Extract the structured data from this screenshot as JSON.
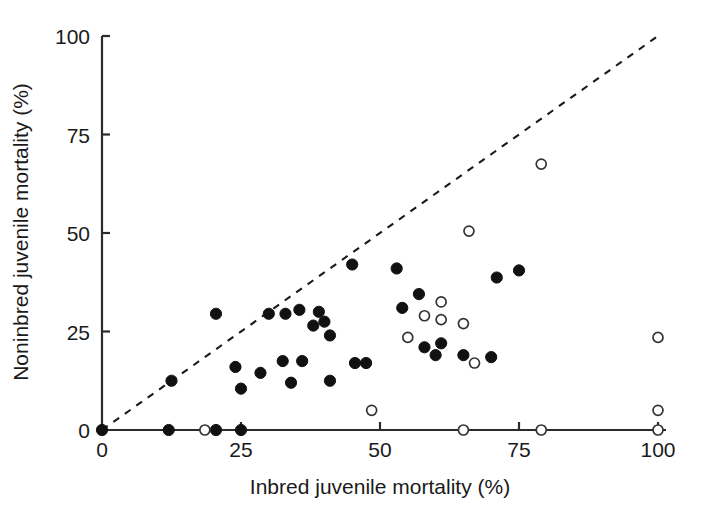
{
  "chart_data": {
    "type": "scatter",
    "title": "",
    "xlabel": "Inbred juvenile mortality (%)",
    "ylabel": "Noninbred juvenile mortality (%)",
    "xlim": [
      0,
      100
    ],
    "ylim": [
      0,
      100
    ],
    "xticks": [
      0,
      25,
      50,
      75,
      100
    ],
    "yticks": [
      0,
      25,
      50,
      75,
      100
    ],
    "xticklabels": [
      "0",
      "25",
      "50",
      "75",
      "100"
    ],
    "yticklabels": [
      "0",
      "25",
      "50",
      "75",
      "100"
    ],
    "grid": false,
    "legend": null,
    "annotations": [
      {
        "name": "identity-reference-line",
        "type": "line",
        "style": "dashed",
        "from": [
          0,
          0
        ],
        "to": [
          100,
          100
        ],
        "label": "y = x"
      }
    ],
    "series": [
      {
        "name": "filled-markers",
        "marker": "filled-circle",
        "color": "#111111",
        "points": [
          [
            0,
            0
          ],
          [
            12,
            0
          ],
          [
            20.5,
            0
          ],
          [
            25,
            0
          ],
          [
            12.5,
            12.5
          ],
          [
            20.5,
            29.5
          ],
          [
            24,
            16
          ],
          [
            25,
            10.5
          ],
          [
            28.5,
            14.5
          ],
          [
            30,
            29.5
          ],
          [
            32.5,
            17.5
          ],
          [
            33,
            29.5
          ],
          [
            34,
            12
          ],
          [
            35.5,
            30.5
          ],
          [
            36,
            17.5
          ],
          [
            38,
            26.5
          ],
          [
            39,
            30
          ],
          [
            40,
            27.5
          ],
          [
            41,
            12.5
          ],
          [
            41,
            24
          ],
          [
            45,
            42
          ],
          [
            45.5,
            17
          ],
          [
            47.5,
            17
          ],
          [
            53,
            41
          ],
          [
            54,
            31
          ],
          [
            57,
            34.5
          ],
          [
            58,
            21
          ],
          [
            60,
            19
          ],
          [
            61,
            22
          ],
          [
            65,
            19
          ],
          [
            70,
            18.5
          ],
          [
            71,
            38.7
          ],
          [
            75,
            40.5
          ]
        ]
      },
      {
        "name": "open-markers",
        "marker": "open-circle",
        "color": "#ffffff",
        "points": [
          [
            18.5,
            0
          ],
          [
            48.5,
            5
          ],
          [
            55,
            23.5
          ],
          [
            58,
            29
          ],
          [
            61,
            28
          ],
          [
            61,
            32.5
          ],
          [
            65,
            27
          ],
          [
            65,
            0
          ],
          [
            66,
            50.5
          ],
          [
            67,
            17
          ],
          [
            79,
            67.5
          ],
          [
            79,
            0
          ],
          [
            100,
            23.5
          ],
          [
            100,
            5
          ],
          [
            100,
            0
          ]
        ]
      }
    ]
  },
  "axes": {
    "x_title": "Inbred juvenile mortality (%)",
    "y_title": "Noninbred juvenile mortality (%)"
  }
}
